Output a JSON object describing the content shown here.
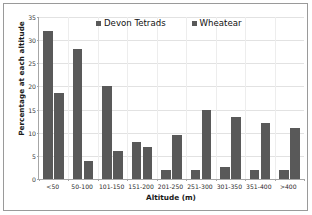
{
  "chart_data": {
    "type": "bar",
    "title": "",
    "xlabel": "Altitude (m)",
    "ylabel": "Percentage at each altitude",
    "categories": [
      "<50",
      "50-100",
      "101-150",
      "151-200",
      "201-250",
      "251-300",
      "301-350",
      "351-400",
      ">400"
    ],
    "series": [
      {
        "name": "Devon Tetrads",
        "color": "#595959",
        "values": [
          32,
          28,
          20,
          8,
          2,
          2,
          2.5,
          2,
          2
        ]
      },
      {
        "name": "Wheatear",
        "color": "#595959",
        "values": [
          18.5,
          4,
          6,
          7,
          9.5,
          15,
          13.5,
          12,
          11
        ]
      }
    ],
    "ylim": [
      0,
      35
    ],
    "yticks": [
      0,
      5,
      10,
      15,
      20,
      25,
      30,
      35
    ],
    "ytick_labels": [
      "0",
      "5",
      "10",
      "15",
      "20",
      "25",
      "30",
      "35"
    ],
    "grid": true,
    "legend_position": "top-center",
    "orientation": "vertical",
    "grouping": "grouped"
  },
  "legend": {
    "entries": [
      {
        "label": "Devon Tetrads"
      },
      {
        "label": "Wheatear"
      }
    ]
  },
  "axes": {
    "x_title": "Altitude (m)",
    "y_title": "Percentage at each altitude"
  }
}
